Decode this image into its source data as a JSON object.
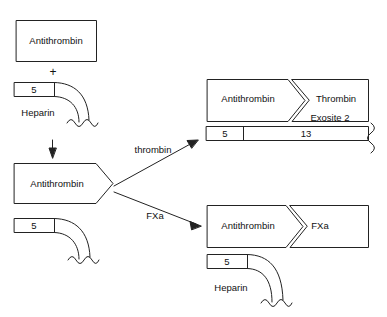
{
  "diagram": {
    "stroke_color": "#222222",
    "background_color": "#ffffff",
    "text_color": "#111111"
  },
  "reactants": {
    "antithrombin_box": {
      "label": "Antithrombin",
      "shape": "rectangle"
    },
    "plus_sign": "+",
    "heparin_chain": {
      "segment_label": "5",
      "name_label": "Heparin",
      "tail": "wavy"
    },
    "down_arrow": "arrow-down"
  },
  "complex": {
    "antithrombin_label": "Antithrombin",
    "shape": "pentagon-arrow",
    "heparin_segment_label": "5",
    "tail": "wavy"
  },
  "arrows": {
    "thrombin_arrow_label": "thrombin",
    "fxa_arrow_label": "FXa"
  },
  "thrombin_complex": {
    "antithrombin_label": "Antithrombin",
    "protease_label": "Thrombin",
    "exosite_label": "Exosite 2",
    "heparin_segments": [
      "5",
      "13"
    ],
    "tail": "wavy-vertical"
  },
  "fxa_complex": {
    "antithrombin_label": "Antithrombin",
    "protease_label": "FXa",
    "heparin_segment_label": "5",
    "heparin_name_label": "Heparin",
    "tail": "wavy"
  }
}
